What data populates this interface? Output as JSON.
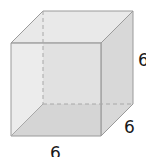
{
  "figure": {
    "type": "cube",
    "labels": {
      "height": "6",
      "depth": "6",
      "width": "6"
    },
    "colors": {
      "face_fill": "#e2e2e2",
      "top_fill": "#e8e8e8",
      "side_fill": "#d9d9d9",
      "bottom_fill": "#cfcfcf",
      "edge": "#9a9a9a",
      "hidden_edge": "#a8a8a8"
    }
  }
}
